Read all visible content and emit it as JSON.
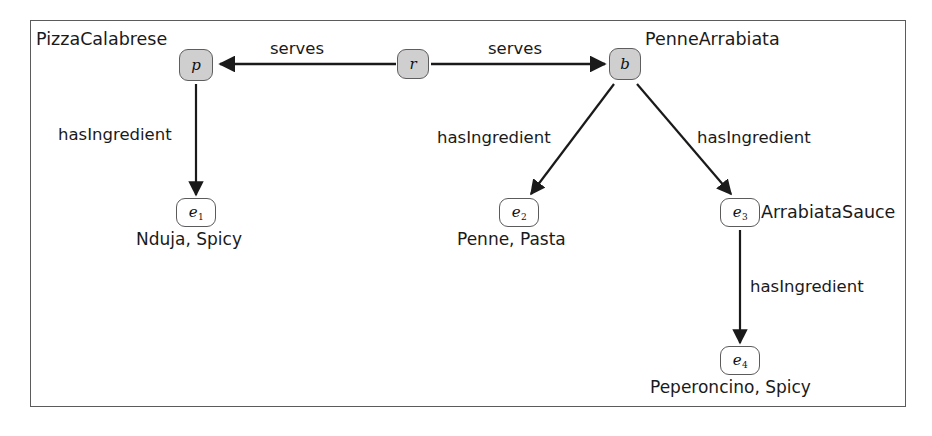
{
  "figure": {
    "frame": {
      "x": 30,
      "y": 20,
      "width": 876,
      "height": 387,
      "border_color": "#5b5b5b"
    }
  },
  "colors": {
    "node_shaded_fill": "#cfcfcf",
    "node_plain_fill": "#ffffff",
    "node_stroke": "#5b5b5b",
    "edge_stroke": "#1a1a1a",
    "text": "#1a1a1a",
    "background": "#ffffff"
  },
  "nodes": [
    {
      "id": "p",
      "label": "p",
      "sub": "",
      "style": "shaded",
      "x": 196,
      "y": 65,
      "w": 34,
      "h": 32,
      "entity_label": "PizzaCalabrese",
      "entity_label_x": 36,
      "entity_label_y": 31
    },
    {
      "id": "r",
      "label": "r",
      "sub": "",
      "style": "shaded",
      "x": 413,
      "y": 64,
      "w": 32,
      "h": 30,
      "entity_label": "",
      "entity_label_x": 0,
      "entity_label_y": 0
    },
    {
      "id": "b",
      "label": "b",
      "sub": "",
      "style": "shaded",
      "x": 625,
      "y": 64,
      "w": 32,
      "h": 32,
      "entity_label": "PenneArrabiata",
      "entity_label_x": 645,
      "entity_label_y": 31
    },
    {
      "id": "e1",
      "label": "e",
      "sub": "1",
      "style": "plain",
      "x": 196,
      "y": 212,
      "w": 40,
      "h": 29,
      "entity_label": "",
      "entity_label_x": 0,
      "entity_label_y": 0
    },
    {
      "id": "e2",
      "label": "e",
      "sub": "2",
      "style": "plain",
      "x": 519,
      "y": 212,
      "w": 40,
      "h": 29,
      "entity_label": "",
      "entity_label_x": 0,
      "entity_label_y": 0
    },
    {
      "id": "e3",
      "label": "e",
      "sub": "3",
      "style": "plain",
      "x": 740,
      "y": 212,
      "w": 40,
      "h": 29,
      "entity_label": "ArrabiataSauce",
      "entity_label_x": 761,
      "entity_label_y": 204
    },
    {
      "id": "e4",
      "label": "e",
      "sub": "4",
      "style": "plain",
      "x": 740,
      "y": 360,
      "w": 40,
      "h": 29,
      "entity_label": "",
      "entity_label_x": 0,
      "entity_label_y": 0
    }
  ],
  "attribute_labels": [
    {
      "for": "e1",
      "text": "Nduja, Spicy",
      "x": 136,
      "y": 231
    },
    {
      "for": "e2",
      "text": "Penne, Pasta",
      "x": 457,
      "y": 231
    },
    {
      "for": "e4",
      "text": "Peperoncino, Spicy",
      "x": 650,
      "y": 379
    }
  ],
  "edges": [
    {
      "id": "r-serves-p",
      "label": "serves",
      "from": "r",
      "to": "p",
      "label_x": 270,
      "label_y": 41
    },
    {
      "id": "r-serves-b",
      "label": "serves",
      "from": "r",
      "to": "b",
      "label_x": 488,
      "label_y": 41
    },
    {
      "id": "p-has-e1",
      "label": "hasIngredient",
      "from": "p",
      "to": "e1",
      "label_x": 58,
      "label_y": 127
    },
    {
      "id": "b-has-e2",
      "label": "hasIngredient",
      "from": "b",
      "to": "e2",
      "label_x": 437,
      "label_y": 130
    },
    {
      "id": "b-has-e3",
      "label": "hasIngredient",
      "from": "b",
      "to": "e3",
      "label_x": 697,
      "label_y": 130
    },
    {
      "id": "e3-has-e4",
      "label": "hasIngredient",
      "from": "e3",
      "to": "e4",
      "label_x": 750,
      "label_y": 279
    }
  ]
}
